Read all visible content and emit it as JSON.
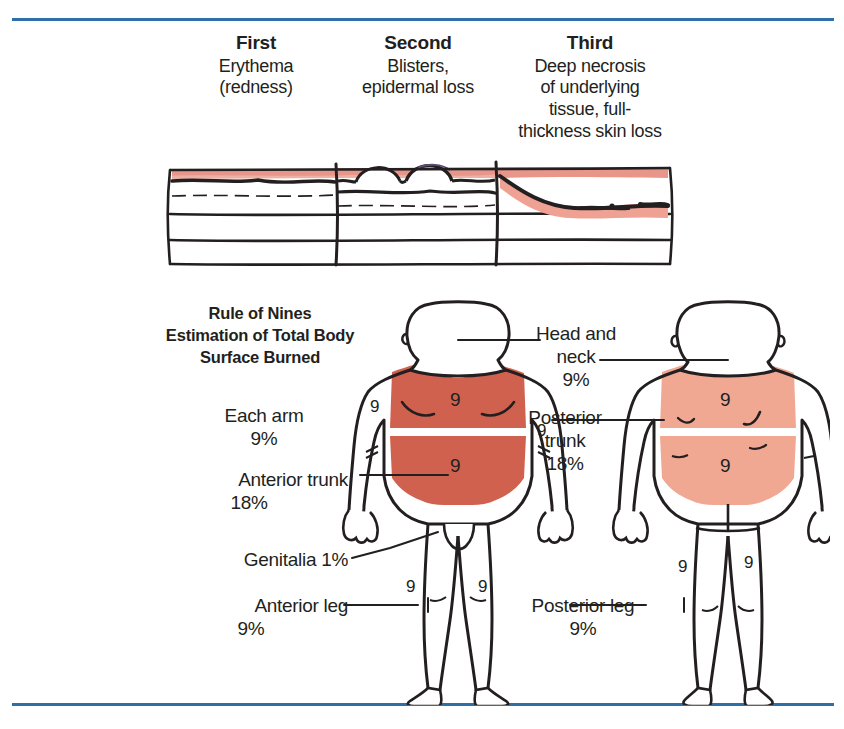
{
  "page": {
    "rule_color": "#2f6fa8",
    "ink": "#231f20"
  },
  "burn_degrees": [
    {
      "title": "First",
      "description": "Erythema\n(redness)"
    },
    {
      "title": "Second",
      "description": "Blisters,\nepidermal loss"
    },
    {
      "title": "Third",
      "description": "Deep necrosis\nof underlying\ntissue, full-\nthickness skin loss"
    }
  ],
  "degree_labels": {
    "first_title": "First",
    "first_desc_1": "Erythema",
    "first_desc_2": "(redness)",
    "second_title": "Second",
    "second_desc_1": "Blisters,",
    "second_desc_2": "epidermal loss",
    "third_title": "Third",
    "third_desc_1": "Deep necrosis",
    "third_desc_2": "of underlying",
    "third_desc_3": "tissue, full-",
    "third_desc_4": "thickness skin loss"
  },
  "rule_of_nines": {
    "title_line1": "Rule of Nines",
    "title_line2": "Estimation of  Total Body",
    "title_line3": "Surface Burned",
    "regions": [
      {
        "name": "Head and neck",
        "percent": "9%",
        "label_line1": "Head and",
        "label_line2": "neck",
        "side": "both"
      },
      {
        "name": "Each arm",
        "percent": "9%",
        "label_line1": "Each arm",
        "side": "anterior"
      },
      {
        "name": "Anterior trunk",
        "percent": "18%",
        "label_line1": "Anterior trunk",
        "side": "anterior"
      },
      {
        "name": "Genitalia",
        "percent": "1%",
        "label_line1": "Genitalia 1%",
        "side": "anterior"
      },
      {
        "name": "Anterior leg",
        "percent": "9%",
        "label_line1": "Anterior leg",
        "side": "anterior"
      },
      {
        "name": "Posterior trunk",
        "percent": "18%",
        "label_line1": "Posterior",
        "label_line2": "trunk",
        "side": "posterior"
      },
      {
        "name": "Posterior leg",
        "percent": "9%",
        "label_line1": "Posterior leg",
        "side": "posterior"
      }
    ],
    "labels": {
      "arm_l1": "Each arm",
      "arm_pct": "9%",
      "ant_trunk_l1": "Anterior trunk",
      "ant_trunk_pct": "18%",
      "genitalia": "Genitalia 1%",
      "ant_leg_l1": "Anterior leg",
      "ant_leg_pct": "9%",
      "head_l1": "Head and",
      "head_l2": "neck",
      "head_pct": "9%",
      "post_trunk_l1": "Posterior",
      "post_trunk_l2": "trunk",
      "post_trunk_pct": "18%",
      "post_leg_l1": "Posterior leg",
      "post_leg_pct": "9%"
    },
    "nine_marker": "9",
    "anterior_nine_markers": [
      "9",
      "9",
      "9",
      "9",
      "9",
      "9"
    ],
    "posterior_nine_markers": [
      "9",
      "9",
      "9",
      "9"
    ],
    "colors": {
      "anterior_shade": "#d1614f",
      "posterior_shade": "#f0a893",
      "outline": "#231f20"
    }
  }
}
